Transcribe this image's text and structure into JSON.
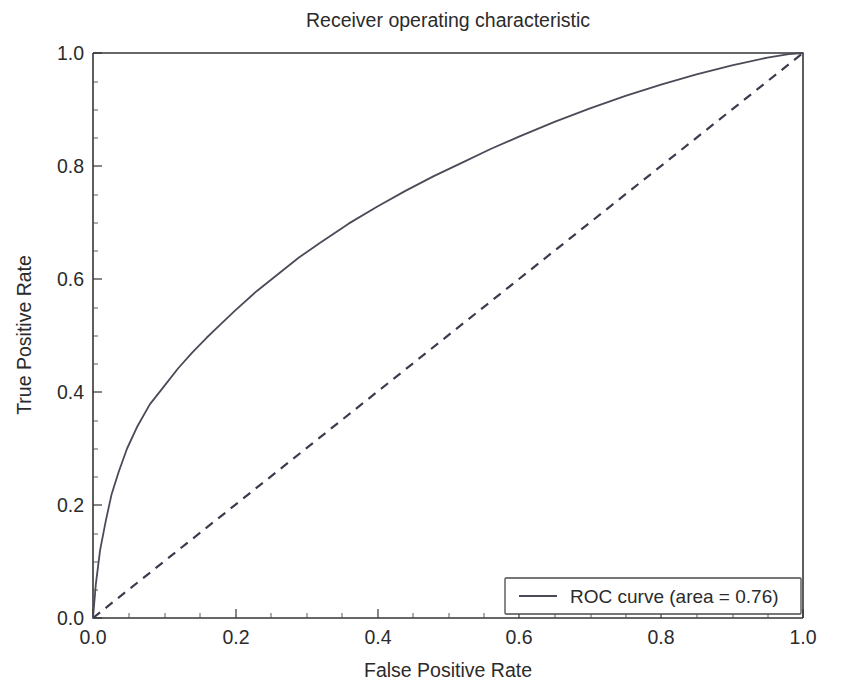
{
  "chart_data": {
    "type": "line",
    "title": "Receiver operating characteristic",
    "xlabel": "False Positive Rate",
    "ylabel": "True Positive Rate",
    "xlim": [
      0.0,
      1.0
    ],
    "ylim": [
      0.0,
      1.0
    ],
    "grid": false,
    "legend_position": "lower right",
    "xticks": [
      "0.0",
      "0.2",
      "0.4",
      "0.6",
      "0.8",
      "1.0"
    ],
    "xtick_values": [
      0.0,
      0.2,
      0.4,
      0.6,
      0.8,
      1.0
    ],
    "yticks": [
      "0.0",
      "0.2",
      "0.4",
      "0.6",
      "0.8",
      "1.0"
    ],
    "ytick_values": [
      0.0,
      0.2,
      0.4,
      0.6,
      0.8,
      1.0
    ],
    "auc": 0.76,
    "series": [
      {
        "name": "ROC curve (area = 0.76)",
        "style": "solid",
        "color": "#4b4b58",
        "x": [
          0.0,
          0.004,
          0.01,
          0.018,
          0.026,
          0.036,
          0.048,
          0.062,
          0.08,
          0.1,
          0.12,
          0.14,
          0.16,
          0.18,
          0.2,
          0.23,
          0.26,
          0.29,
          0.32,
          0.36,
          0.4,
          0.44,
          0.48,
          0.52,
          0.56,
          0.6,
          0.65,
          0.7,
          0.75,
          0.8,
          0.85,
          0.9,
          0.95,
          0.98,
          1.0
        ],
        "y": [
          0.0,
          0.06,
          0.12,
          0.172,
          0.218,
          0.258,
          0.3,
          0.338,
          0.378,
          0.41,
          0.442,
          0.47,
          0.496,
          0.52,
          0.544,
          0.578,
          0.608,
          0.638,
          0.664,
          0.698,
          0.728,
          0.756,
          0.782,
          0.806,
          0.83,
          0.852,
          0.878,
          0.902,
          0.924,
          0.944,
          0.962,
          0.978,
          0.992,
          0.998,
          1.0
        ]
      },
      {
        "name": "chance-diagonal",
        "style": "dashed",
        "color": "#3b3b4d",
        "x": [
          0.0,
          1.0
        ],
        "y": [
          0.0,
          1.0
        ]
      }
    ]
  },
  "legend": {
    "entries": [
      {
        "label": "ROC curve (area = 0.76)",
        "marker": "line-solid"
      }
    ]
  }
}
